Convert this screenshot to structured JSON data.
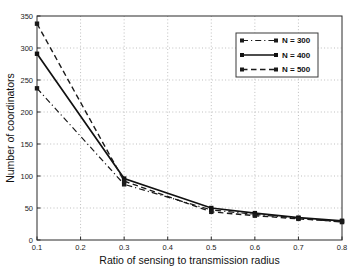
{
  "chart_data": {
    "type": "line",
    "title": "",
    "xlabel": "Ratio of sensing to transmission radius",
    "ylabel": "Number of coordinators",
    "x": [
      0.1,
      0.3,
      0.5,
      0.6,
      0.7,
      0.8
    ],
    "series": [
      {
        "name": "N = 300",
        "values": [
          237,
          87,
          47,
          40,
          34,
          28
        ],
        "line_style": "dash-dot",
        "marker": "square",
        "color": "#1a1a1a"
      },
      {
        "name": "N = 400",
        "values": [
          291,
          96,
          50,
          42,
          35,
          30
        ],
        "line_style": "solid",
        "marker": "square",
        "color": "#111111"
      },
      {
        "name": "N = 500",
        "values": [
          338,
          92,
          44,
          38,
          33,
          29
        ],
        "line_style": "dashed",
        "marker": "square",
        "color": "#1a1a1a"
      }
    ],
    "xlim": [
      0.1,
      0.8
    ],
    "ylim": [
      0,
      350
    ],
    "x_ticks": [
      "0.1",
      "0.2",
      "0.3",
      "0.4",
      "0.5",
      "0.6",
      "0.7",
      "0.8"
    ],
    "y_ticks": [
      "0",
      "50",
      "100",
      "150",
      "200",
      "250",
      "300",
      "350"
    ],
    "grid": true,
    "grid_style": "dotted",
    "legend_position": "top-right",
    "legend_entries": [
      "N = 300",
      "N = 400",
      "N = 500"
    ],
    "colors": {
      "axis": "#2b2b2b",
      "grid": "#b8b8b8",
      "text": "#1c1c1c",
      "background": "#ffffff",
      "legend_border": "#3a3a3a"
    }
  }
}
